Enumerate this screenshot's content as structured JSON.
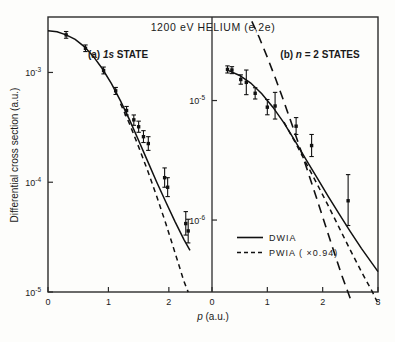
{
  "figure": {
    "title": "1200 eV  HELIUM  (e,2e)",
    "ylabel": "Differential cross section (a.u.)",
    "xlabel_italic": "p",
    "xlabel_rest": " (a.u.)"
  },
  "legend": {
    "position": "center-bottom",
    "entries": [
      {
        "label": "DWIA",
        "style": "solid"
      },
      {
        "label": "PWIA ( ×0.94)",
        "style": "dashed"
      }
    ]
  },
  "panels": [
    {
      "id": "a",
      "label_prefix": "(a) ",
      "label_italic": "1s",
      "label_rest": " STATE"
    },
    {
      "id": "b",
      "label_prefix": "(b) ",
      "label_italic": "n",
      "label_rest": " = 2 STATES"
    }
  ],
  "axis_ticks": {
    "panel_a_y": [
      {
        "mantissa": "10",
        "exp": "-3"
      },
      {
        "mantissa": "10",
        "exp": "-4"
      },
      {
        "mantissa": "10",
        "exp": "-5"
      }
    ],
    "panel_b_y": [
      {
        "mantissa": "10",
        "exp": "-5"
      },
      {
        "mantissa": "10",
        "exp": "-6"
      }
    ],
    "panel_a_x": [
      "0",
      "1",
      "2"
    ],
    "panel_b_x": [
      "0",
      "1",
      "2",
      "3"
    ]
  },
  "chart_data": {
    "type": "line",
    "title": "1200 eV HELIUM (e,2e)",
    "xlabel": "p (a.u.)",
    "ylabel": "Differential cross section (a.u.)",
    "grid": false,
    "legend_position": "center-bottom",
    "panels": [
      {
        "id": "a",
        "title": "(a) 1s STATE",
        "xlim": [
          0,
          2.35
        ],
        "ylim": [
          1e-05,
          0.0032
        ],
        "yscale": "log",
        "xticks": [
          0,
          1,
          2
        ],
        "yticks": [
          0.001,
          0.0001,
          1e-05
        ],
        "series": [
          {
            "name": "DWIA",
            "style": "solid",
            "x": [
              0.0,
              0.15,
              0.3,
              0.45,
              0.6,
              0.75,
              0.9,
              1.05,
              1.2,
              1.35,
              1.5,
              1.65,
              1.8,
              1.95,
              2.1,
              2.25,
              2.35
            ],
            "y": [
              0.0024,
              0.00235,
              0.0022,
              0.002,
              0.00172,
              0.0014,
              0.00108,
              0.00079,
              0.00055,
              0.00037,
              0.00024,
              0.000155,
              0.0001,
              6.6e-05,
              4.4e-05,
              3e-05,
              2.4e-05
            ]
          },
          {
            "name": "PWIA ( x0.94)",
            "style": "dashed",
            "x": [
              1.2,
              1.35,
              1.5,
              1.65,
              1.8,
              1.95,
              2.1,
              2.25,
              2.32
            ],
            "y": [
              0.00052,
              0.00034,
              0.00021,
              0.000127,
              7.4e-05,
              4.2e-05,
              2.3e-05,
              1.25e-05,
              1e-05
            ]
          }
        ],
        "points": [
          {
            "x": 0.3,
            "y": 0.0022,
            "yerr_lo": 0.00205,
            "yerr_hi": 0.00236
          },
          {
            "x": 0.62,
            "y": 0.00166,
            "yerr_lo": 0.00155,
            "yerr_hi": 0.00178
          },
          {
            "x": 0.92,
            "y": 0.00104,
            "yerr_lo": 0.00097,
            "yerr_hi": 0.00112
          },
          {
            "x": 1.12,
            "y": 0.00068,
            "yerr_lo": 0.00063,
            "yerr_hi": 0.00073
          },
          {
            "x": 1.3,
            "y": 0.00045,
            "yerr_lo": 0.00041,
            "yerr_hi": 0.00049
          },
          {
            "x": 1.42,
            "y": 0.00037,
            "yerr_lo": 0.00033,
            "yerr_hi": 0.00041
          },
          {
            "x": 1.5,
            "y": 0.00032,
            "yerr_lo": 0.000285,
            "yerr_hi": 0.00036
          },
          {
            "x": 1.58,
            "y": 0.00026,
            "yerr_lo": 0.00023,
            "yerr_hi": 0.000295
          },
          {
            "x": 1.66,
            "y": 0.000225,
            "yerr_lo": 0.000195,
            "yerr_hi": 0.00026
          },
          {
            "x": 1.93,
            "y": 0.00011,
            "yerr_lo": 9e-05,
            "yerr_hi": 0.000135
          },
          {
            "x": 1.98,
            "y": 9e-05,
            "yerr_lo": 7.4e-05,
            "yerr_hi": 0.00011
          },
          {
            "x": 2.28,
            "y": 4.2e-05,
            "yerr_lo": 3.3e-05,
            "yerr_hi": 5.4e-05
          },
          {
            "x": 2.32,
            "y": 3.6e-05,
            "yerr_lo": 2.8e-05,
            "yerr_hi": 4.6e-05
          }
        ]
      },
      {
        "id": "b",
        "title": "(b) n = 2 STATES",
        "xlim": [
          0,
          3
        ],
        "ylim": [
          2.5e-07,
          5e-05
        ],
        "yscale": "log",
        "xticks": [
          0,
          1,
          2,
          3
        ],
        "yticks": [
          1e-05,
          1e-06
        ],
        "series": [
          {
            "name": "DWIA",
            "style": "solid",
            "x": [
              0.3,
              0.5,
              0.7,
              0.9,
              1.1,
              1.3,
              1.5,
              1.7,
              1.9,
              2.1,
              2.3,
              2.5,
              2.7,
              2.9,
              3.0
            ],
            "y": [
              1.78e-05,
              1.62e-05,
              1.4e-05,
              1.14e-05,
              8.8e-06,
              6.5e-06,
              4.6e-06,
              3.2e-06,
              2.25e-06,
              1.58e-06,
              1.12e-06,
              8e-07,
              5.8e-07,
              4.3e-07,
              3.7e-07
            ]
          },
          {
            "name": "PWIA ( x0.94)",
            "style": "dashed",
            "x": [
              1.3,
              1.5,
              1.7,
              1.9,
              2.1,
              2.3,
              2.5,
              2.7,
              2.9,
              3.0
            ],
            "y": [
              6.6e-06,
              4.5e-06,
              3e-06,
              2e-06,
              1.32e-06,
              8.6e-07,
              5.6e-07,
              3.7e-07,
              2.5e-07,
              2e-07
            ]
          },
          {
            "name": "PWIA-unscaled",
            "style": "long-dashed",
            "x": [
              0.72,
              0.85,
              1.0,
              1.15,
              1.3,
              1.45,
              1.6,
              1.75,
              1.9,
              2.05,
              2.2,
              2.35,
              2.5
            ],
            "y": [
              4.6e-05,
              3.4e-05,
              2.3e-05,
              1.52e-05,
              9.8e-06,
              6.2e-06,
              3.9e-06,
              2.4e-06,
              1.48e-06,
              9e-07,
              5.5e-07,
              3.4e-07,
              2.2e-07
            ]
          }
        ],
        "points": [
          {
            "x": 0.28,
            "y": 1.82e-05,
            "yerr_lo": 1.7e-05,
            "yerr_hi": 1.95e-05
          },
          {
            "x": 0.36,
            "y": 1.8e-05,
            "yerr_lo": 1.68e-05,
            "yerr_hi": 1.92e-05
          },
          {
            "x": 0.52,
            "y": 1.5e-05,
            "yerr_lo": 1.37e-05,
            "yerr_hi": 1.64e-05
          },
          {
            "x": 0.62,
            "y": 1.42e-05,
            "yerr_lo": 1.12e-05,
            "yerr_hi": 1.8e-05
          },
          {
            "x": 0.78,
            "y": 1.15e-05,
            "yerr_lo": 1.03e-05,
            "yerr_hi": 1.28e-05
          },
          {
            "x": 1.0,
            "y": 8.8e-06,
            "yerr_lo": 7.6e-06,
            "yerr_hi": 1.02e-05
          },
          {
            "x": 1.14,
            "y": 9e-06,
            "yerr_lo": 7e-06,
            "yerr_hi": 1.17e-05
          },
          {
            "x": 1.52,
            "y": 6.1e-06,
            "yerr_lo": 5.2e-06,
            "yerr_hi": 7.2e-06
          },
          {
            "x": 1.8,
            "y": 4.2e-06,
            "yerr_lo": 3.4e-06,
            "yerr_hi": 5.2e-06
          },
          {
            "x": 2.46,
            "y": 1.45e-06,
            "yerr_lo": 9e-07,
            "yerr_hi": 2.4e-06
          }
        ]
      }
    ]
  }
}
